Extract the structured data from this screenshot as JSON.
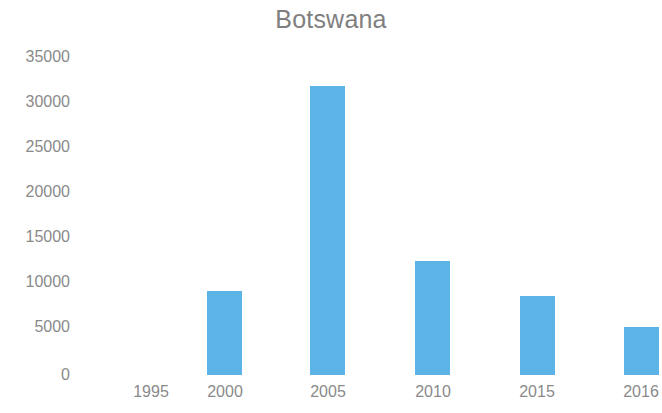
{
  "chart_data": {
    "type": "bar",
    "title": "Botswana",
    "subtitle": "",
    "xlabel": "",
    "ylabel": "",
    "categories": [
      "1995",
      "2000",
      "2005",
      "2010",
      "2015",
      "2016"
    ],
    "values": [
      0,
      9300,
      31800,
      12500,
      8700,
      5300
    ],
    "series": [
      {
        "name": "Botswana",
        "values": [
          0,
          9300,
          31800,
          12500,
          8700,
          5300
        ]
      }
    ],
    "ylim": [
      0,
      35000
    ],
    "ytick_labels": [
      "0",
      "5000",
      "10000",
      "15000",
      "20000",
      "25000",
      "30000",
      "35000"
    ],
    "ytick_values": [
      0,
      5000,
      10000,
      15000,
      20000,
      25000,
      30000,
      35000
    ],
    "xtick_labels": [
      "1995",
      "2000",
      "2005",
      "2010",
      "2015",
      "2016"
    ],
    "grid": false,
    "legend": false,
    "legend_position": "none",
    "annotations": [],
    "colors": {
      "bar": "#5bb4e5",
      "text": "#8a8a8a",
      "title": "#7f7f7f",
      "background": "#ffffff"
    }
  }
}
